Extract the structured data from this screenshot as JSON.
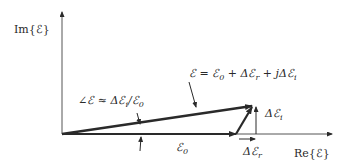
{
  "diagram": {
    "axes": {
      "y_label": "Im{ℰ}",
      "x_label": "Re{ℰ}"
    },
    "equation": {
      "lhs": "ℰ",
      "eq": "=",
      "t1": "ℰ",
      "t1_sub": "0",
      "plus1": "+",
      "t2": "Δℰ",
      "t2_sub": "r",
      "plus2": "+",
      "t3": "jΔℰ",
      "t3_sub": "i"
    },
    "angle_label": {
      "prefix": "∠ℰ",
      "approx": "≈",
      "num": "Δℰ",
      "num_sub": "i",
      "slash": "/ℰ",
      "den_sub": "0"
    },
    "e0_label": {
      "text": "ℰ",
      "sub": "0"
    },
    "dei_label": {
      "text": "Δℰ",
      "sub": "i"
    },
    "der_label": {
      "text": "Δℰ",
      "sub": "r"
    },
    "colors": {
      "ink": "#2a2a2a",
      "axis": "#555555"
    }
  }
}
